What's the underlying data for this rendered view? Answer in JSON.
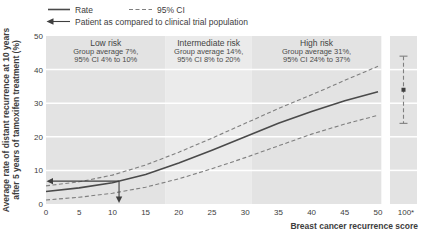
{
  "legend": {
    "rate_label": "Rate",
    "ci_label": "95% CI",
    "patient_label": "Patient as compared to clinical trial population"
  },
  "y_axis": {
    "title_line1": "Average rate of distant recurrence at 10 years",
    "title_line2": "after 5 years of tamoxifen treatment (%)",
    "ticks": [
      0,
      10,
      20,
      30,
      40,
      50
    ],
    "range": [
      0,
      50
    ]
  },
  "x_axis": {
    "title": "Breast cancer recurrence score",
    "ticks": [
      0,
      5,
      10,
      15,
      20,
      25,
      30,
      35,
      40,
      45,
      50
    ],
    "outlier_tick_label": "100*",
    "range": [
      0,
      50
    ]
  },
  "chart_data": {
    "type": "line",
    "title": "",
    "xlabel": "Breast cancer recurrence score",
    "ylabel": "Average rate of distant recurrence at 10 years after 5 years of tamoxifen treatment (%)",
    "xlim": [
      0,
      50
    ],
    "ylim": [
      0,
      50
    ],
    "grid": true,
    "legend_position": "top-left",
    "bands": [
      {
        "label": "Low risk",
        "sub1": "Group average 7%,",
        "sub2": "95% CI 4% to 10%",
        "from": 0,
        "to": 18,
        "shade": "#e3e3e3"
      },
      {
        "label": "Intermediate risk",
        "sub1": "Group average 14%,",
        "sub2": "95% CI 8% to 20%",
        "from": 18,
        "to": 31,
        "shade": "#ebebeb"
      },
      {
        "label": "High risk",
        "sub1": "Group average 31%,",
        "sub2": "95% CI 24% to 37%",
        "from": 31,
        "to": 50.5,
        "shade": "#e3e3e3"
      }
    ],
    "series": [
      {
        "name": "Rate",
        "style": "solid",
        "x": [
          0,
          5,
          10,
          15,
          20,
          25,
          30,
          35,
          40,
          45,
          50
        ],
        "y": [
          3.7,
          4.8,
          6.3,
          8.8,
          12.2,
          16.0,
          20.0,
          24.0,
          27.5,
          30.7,
          33.4
        ]
      },
      {
        "name": "95% CI upper",
        "style": "dashed",
        "x": [
          0,
          5,
          10,
          15,
          20,
          25,
          30,
          35,
          40,
          45,
          50
        ],
        "y": [
          5.4,
          6.6,
          8.6,
          11.6,
          15.4,
          19.6,
          24.0,
          28.4,
          32.5,
          36.8,
          41.0
        ]
      },
      {
        "name": "95% CI lower",
        "style": "dashed",
        "x": [
          0,
          5,
          10,
          15,
          20,
          25,
          30,
          35,
          40,
          45,
          50
        ],
        "y": [
          1.2,
          2.0,
          3.2,
          5.0,
          7.5,
          10.5,
          13.8,
          17.3,
          20.8,
          23.8,
          26.4
        ]
      }
    ],
    "patient": {
      "score": 11,
      "rate": 6.8
    },
    "outlier": {
      "score_label": "100*",
      "center": 34,
      "ci_low": 24,
      "ci_high": 44,
      "band_shade": "#e3e3e3"
    }
  },
  "colors": {
    "background": "#ffffff",
    "gridline": "#ffffff",
    "rate_line": "#4a4a4a",
    "ci_line": "#7f7f7f",
    "arrow": "#3f3f3f",
    "text": "#3d3d3d",
    "band_light": "#e3e3e3",
    "band_mid": "#ebebeb"
  }
}
